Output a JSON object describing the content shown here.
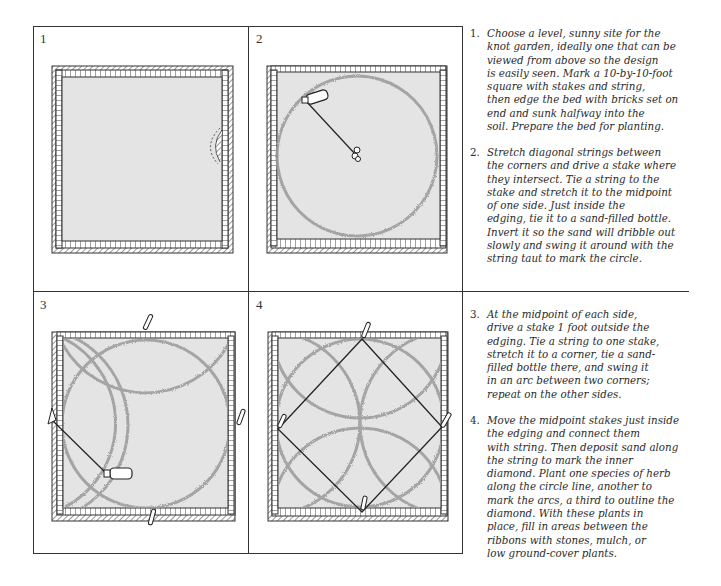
{
  "panels": [
    {
      "number": "1",
      "caption_ref": "Brick-edged 10-by-10-foot bed"
    },
    {
      "number": "2",
      "caption_ref": "Circle marked with bottle and center stake"
    },
    {
      "number": "3",
      "caption_ref": "Arcs swung from midpoint stakes"
    },
    {
      "number": "4",
      "caption_ref": "Inner diamond strung between midpoint stakes"
    }
  ],
  "steps": [
    {
      "number": "1.",
      "text": "Choose a level, sunny site for the\nknot garden, ideally one that can be\nviewed from above so the design\nis easily seen. Mark a 10-by-10-foot\nsquare with stakes and string,\nthen edge the bed with bricks set on\nend and sunk halfway into the\nsoil. Prepare the bed for planting."
    },
    {
      "number": "2.",
      "text": "Stretch diagonal strings between\nthe corners and drive a stake where\nthey intersect. Tie a string to the\nstake and stretch it to the midpoint\nof one side. Just inside the\nedging, tie it to a sand-filled bottle.\nInvert it so the sand will dribble out\nslowly and swing it around with the\nstring taut to mark the circle."
    },
    {
      "number": "3.",
      "text": "At the midpoint of each side,\ndrive a stake 1 foot outside the\nedging. Tie a string to one stake,\nstretch it to a corner, tie a sand-\nfilled bottle there, and swing it\nin an arc between two corners;\nrepeat on the other sides."
    },
    {
      "number": "4.",
      "text": "Move the midpoint stakes just inside\nthe edging and connect them\nwith string. Then deposit sand along\nthe string to mark the inner\ndiamond. Plant one species of herb\nalong the circle line, another to\nmark the arcs, a third to outline the\ndiamond. With these plants in\nplace, fill in areas between the\nribbons with stones, mulch, or\nlow ground-cover plants."
    }
  ],
  "colors": {
    "line": "#333333",
    "bed_fill": "#e4e4e4",
    "sand": "#9a9a9a"
  }
}
